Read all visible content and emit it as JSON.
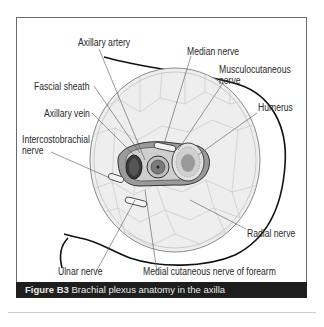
{
  "figure": {
    "number": "Figure B3",
    "title": "Brachial plexus anatomy in the axilla",
    "caption_bar_color": "#1e1e1e"
  },
  "labels": {
    "axillary_artery": "Axillary artery",
    "median_nerve": "Median nerve",
    "musculocutaneous_nerve": "Musculocutaneous nerve",
    "musculocutaneous_line1": "Musculocutaneous",
    "musculocutaneous_line2": "nerve",
    "fascial_sheath": "Fascial sheath",
    "axillary_vein": "Axillary vein",
    "humerus": "Humerus",
    "intercostobrachial_line1": "Intercostobrachial",
    "intercostobrachial_line2": "nerve",
    "radial_nerve": "Radial nerve",
    "ulnar_nerve": "Ulnar nerve",
    "medial_cutaneous_nerve": "Medial cutaneous nerve of forearm"
  }
}
